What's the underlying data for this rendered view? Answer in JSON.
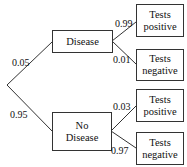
{
  "diagram": {
    "type": "probability-tree",
    "level1": [
      {
        "label": "Disease",
        "prob": "0.05",
        "children": [
          {
            "line1": "Tests",
            "line2": "positive",
            "prob": "0.99"
          },
          {
            "line1": "Tests",
            "line2": "negative",
            "prob": "0.01"
          }
        ]
      },
      {
        "line1": "No",
        "line2": "Disease",
        "prob": "0.95",
        "children": [
          {
            "line1": "Tests",
            "line2": "positive",
            "prob": "0.03"
          },
          {
            "line1": "Tests",
            "line2": "negative",
            "prob": "0.97"
          }
        ]
      }
    ]
  }
}
